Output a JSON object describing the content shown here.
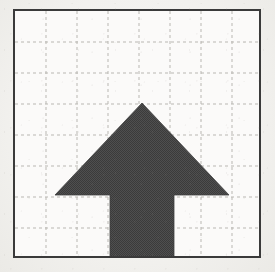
{
  "figure": {
    "title": "",
    "caption": "",
    "background_color": "#f2f1ee",
    "paper_color": "#fbfaf9"
  },
  "frame": {
    "border_color": "#3a3a3a",
    "border_width_px": 2,
    "x": 13,
    "y": 9,
    "width": 248,
    "height": 249
  },
  "grid": {
    "line_color": "#b9b7b2",
    "line_style": "dashed",
    "dash_pattern": "3 3",
    "line_width_px": 1,
    "columns": 8,
    "rows": 8,
    "cell_size_px": 31,
    "vertical_line_x": [
      31,
      62,
      93,
      124,
      155,
      186,
      217
    ],
    "horizontal_line_y": [
      31,
      62,
      93,
      124,
      155,
      186,
      217
    ]
  },
  "arrow": {
    "label": "up-arrow",
    "direction": "up",
    "fill_color": "#4a4a4a",
    "fill_texture": "halftone-dither",
    "outline_color": "#3f3f3f",
    "points": "127,92 214,184 159,184 159,248 95,248 95,184 40,184",
    "vertices": {
      "apex": [
        127,
        92
      ],
      "right_wing_tip": [
        214,
        184
      ],
      "right_shoulder": [
        159,
        184
      ],
      "right_shaft_bottom": [
        159,
        248
      ],
      "left_shaft_bottom": [
        95,
        248
      ],
      "left_shoulder": [
        95,
        184
      ],
      "left_wing_tip": [
        40,
        184
      ]
    },
    "shaft_width_px": 64,
    "head_width_px": 174,
    "head_height_px": 92,
    "total_height_px": 156
  },
  "showthrough": {
    "note": "faint mirrored text bleeding through from the reverse side of the scanned page",
    "color": "#d4d1cb",
    "lines": [
      {
        "id": "top",
        "text": "and conditions and conditions"
      },
      {
        "id": "mid",
        "text": "the same the same"
      },
      {
        "id": "low",
        "text": "section and section"
      },
      {
        "id": "bottom",
        "text": "00 10 100 00 10"
      }
    ]
  },
  "chart_data": {
    "type": "diagram",
    "title": "",
    "xlabel": "",
    "ylabel": "",
    "grid": true,
    "xlim": [
      0,
      8
    ],
    "ylim": [
      0,
      8
    ],
    "shapes": [
      {
        "name": "up-arrow",
        "type": "polygon",
        "fill": "#4a4a4a",
        "points_grid": [
          [
            3.68,
            5.13
          ],
          [
            6.48,
            2.16
          ],
          [
            4.71,
            2.16
          ],
          [
            4.71,
            0.0
          ],
          [
            2.65,
            0.0
          ],
          [
            2.65,
            2.16
          ],
          [
            0.87,
            2.16
          ]
        ]
      }
    ]
  }
}
